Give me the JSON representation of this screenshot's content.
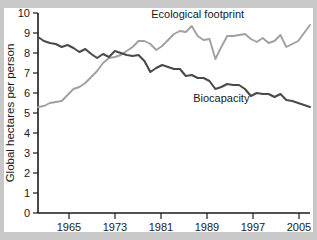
{
  "chart_data": {
    "type": "line",
    "title": "",
    "xlabel": "",
    "ylabel": "Global hectares per person",
    "xlim": [
      1961,
      2007
    ],
    "ylim": [
      0,
      10
    ],
    "grid": false,
    "legend_position": "inline-annotations",
    "xticks": [
      "1965",
      "1973",
      "1981",
      "1989",
      "1997",
      "2005"
    ],
    "xtick_values": [
      1965,
      1973,
      1981,
      1989,
      1997,
      2005
    ],
    "yticks": [
      "0",
      "1",
      "2",
      "3",
      "4",
      "5",
      "6",
      "7",
      "8",
      "9",
      "10"
    ],
    "ytick_values": [
      0,
      1,
      2,
      3,
      4,
      5,
      6,
      7,
      8,
      9,
      10
    ],
    "x": [
      1961,
      1962,
      1963,
      1964,
      1965,
      1966,
      1967,
      1968,
      1969,
      1970,
      1971,
      1972,
      1973,
      1974,
      1975,
      1976,
      1977,
      1978,
      1979,
      1980,
      1981,
      1982,
      1983,
      1984,
      1985,
      1986,
      1987,
      1988,
      1989,
      1990,
      1991,
      1992,
      1993,
      1994,
      1995,
      1996,
      1997,
      1998,
      1999,
      2000,
      2001,
      2002,
      2003,
      2004,
      2005,
      2006,
      2007
    ],
    "series": [
      {
        "name": "Ecological footprint",
        "color": "#a0a0a0",
        "values": [
          5.3,
          5.35,
          5.5,
          5.55,
          5.6,
          5.9,
          6.2,
          6.3,
          6.5,
          6.8,
          7.1,
          7.5,
          7.75,
          7.8,
          7.9,
          8.1,
          8.3,
          8.6,
          8.6,
          8.45,
          8.15,
          8.35,
          8.65,
          8.95,
          9.1,
          9.05,
          9.35,
          8.85,
          8.65,
          8.7,
          7.7,
          8.3,
          8.85,
          8.85,
          8.9,
          8.95,
          8.7,
          8.55,
          8.75,
          8.5,
          8.6,
          8.9,
          8.3,
          8.45,
          8.6,
          9.0,
          9.4
        ]
      },
      {
        "name": "Biocapacity",
        "color": "#4a4a4a",
        "values": [
          8.8,
          8.6,
          8.5,
          8.45,
          8.3,
          8.4,
          8.25,
          8.05,
          8.2,
          7.95,
          7.75,
          7.95,
          7.8,
          8.1,
          8.0,
          7.9,
          7.85,
          7.9,
          7.6,
          7.05,
          7.25,
          7.4,
          7.3,
          7.2,
          7.2,
          6.85,
          6.9,
          6.75,
          6.75,
          6.6,
          6.2,
          6.3,
          6.45,
          6.4,
          6.4,
          6.2,
          5.85,
          6.0,
          5.95,
          5.95,
          5.8,
          5.95,
          5.65,
          5.6,
          5.5,
          5.4,
          5.3
        ],
        "values_note": [
          5.1,
          5.05,
          5.0
        ]
      }
    ],
    "annotations": [
      {
        "text": "Ecological footprint",
        "x": 1988,
        "y": 9.75
      },
      {
        "text": "Biocapacity",
        "x": 1992,
        "y": 5.55
      }
    ]
  },
  "axis": {
    "ylabel": "Global hectares per person",
    "ytick_0": "0",
    "ytick_1": "1",
    "ytick_2": "2",
    "ytick_3": "3",
    "ytick_4": "4",
    "ytick_5": "5",
    "ytick_6": "6",
    "ytick_7": "7",
    "ytick_8": "8",
    "ytick_9": "9",
    "ytick_10": "10",
    "xtick_1965": "1965",
    "xtick_1973": "1973",
    "xtick_1981": "1981",
    "xtick_1989": "1989",
    "xtick_1997": "1997",
    "xtick_2005": "2005"
  },
  "labels": {
    "ecological_footprint": "Ecological footprint",
    "biocapacity": "Biocapacity"
  },
  "colors": {
    "ecological_footprint_line": "#a0a0a0",
    "biocapacity_line": "#4a4a4a",
    "axis": "#1a1a1a",
    "panel_background": "#ffffff",
    "outer_background": "#c8c8c8"
  }
}
